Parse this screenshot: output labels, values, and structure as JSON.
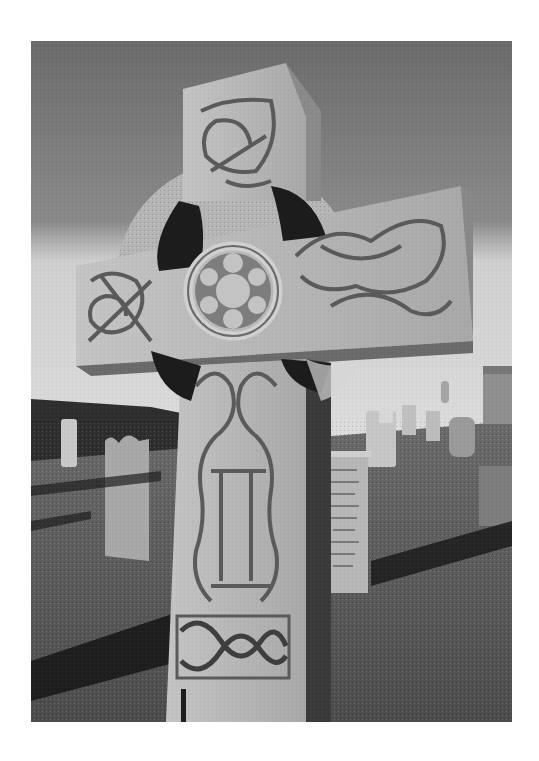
{
  "page": {
    "background": "#ffffff"
  },
  "photo": {
    "subject": "Celtic high cross with knotwork carving in a graveyard",
    "mode": "black-and-white",
    "colors": {
      "sky_top": "#6b6b6b",
      "sky_horizon": "#cfcfcf",
      "stone_light": "#bdbdbd",
      "stone_mid": "#9a9a9a",
      "stone_shadow": "#3a3a3a",
      "hole": "#1c1c1c",
      "grass": "#5c5c5c",
      "shadow": "#1e1e1e",
      "wall": "#2e2e2e"
    },
    "elements": [
      "celtic-cross",
      "cross-ring",
      "center-roundel",
      "knotwork-panels",
      "background-headstones",
      "stone-wall",
      "building",
      "grass",
      "cast-shadows"
    ]
  }
}
